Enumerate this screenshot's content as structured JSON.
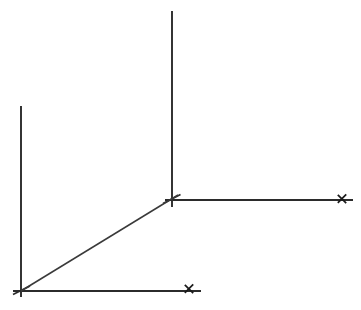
{
  "figure": {
    "background_color": "#ffffff",
    "ink_color": "#2b2b2b",
    "width": 361,
    "height": 310
  },
  "chart_data": {
    "type": "diagram",
    "title": "",
    "xlabel": "",
    "ylabel": "",
    "grid": false,
    "legend": false,
    "annotations": [
      {
        "id": "x-mark-right",
        "label": "x",
        "x": 342,
        "y": 199
      },
      {
        "id": "x-mark-bottom",
        "label": "x",
        "x": 189,
        "y": 289
      }
    ],
    "points": [
      {
        "id": "upper-origin",
        "label": "",
        "x": 172,
        "y": 200
      },
      {
        "id": "lower-origin",
        "label": "",
        "x": 21,
        "y": 291
      },
      {
        "id": "upper-vertical-top",
        "label": "",
        "x": 172,
        "y": 11
      },
      {
        "id": "left-vertical-top",
        "label": "",
        "x": 21,
        "y": 106
      },
      {
        "id": "upper-horizontal-end",
        "label": "",
        "x": 353,
        "y": 200
      },
      {
        "id": "lower-horizontal-end",
        "label": "",
        "x": 201,
        "y": 291
      }
    ],
    "segments": [
      {
        "id": "upper-vertical-axis",
        "x1": 172,
        "y1": 11,
        "x2": 172,
        "y2": 207
      },
      {
        "id": "upper-horizontal-axis",
        "x1": 165,
        "y1": 200,
        "x2": 353,
        "y2": 200
      },
      {
        "id": "left-vertical-axis",
        "x1": 21,
        "y1": 106,
        "x2": 21,
        "y2": 297
      },
      {
        "id": "lower-horizontal-axis",
        "x1": 13,
        "y1": 291,
        "x2": 201,
        "y2": 291
      },
      {
        "id": "diagonal-axis",
        "x1": 21,
        "y1": 291,
        "x2": 178,
        "y2": 195
      }
    ]
  }
}
